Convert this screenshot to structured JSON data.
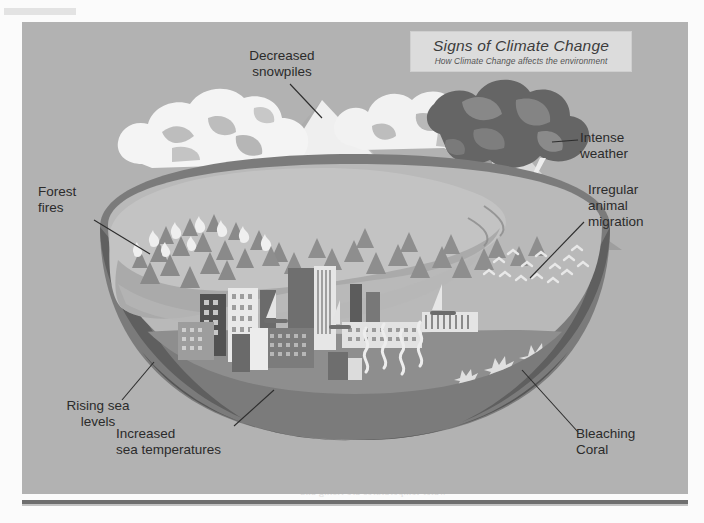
{
  "document": {
    "kind": "scanned-textbook-page",
    "page_background": "#fbfbfb",
    "panel_background": "#b2b2b2"
  },
  "illustration": {
    "title_plate": {
      "title": "Signs of Climate Change",
      "subtitle": "How Climate Change affects the environment",
      "plate_color": "#dcdcdc"
    },
    "labels": [
      {
        "id": "decreased-snowpiles",
        "text": "Decreased\nsnowpiles",
        "align": "center"
      },
      {
        "id": "intense-weather",
        "text": "Intense\nweather",
        "align": "left"
      },
      {
        "id": "irregular-migration",
        "text": "Irregular\nanimal\nmigration",
        "align": "left"
      },
      {
        "id": "forest-fires",
        "text": "Forest\nfires",
        "align": "left"
      },
      {
        "id": "rising-sea-levels",
        "text": "Rising sea\nlevels",
        "align": "center"
      },
      {
        "id": "increased-sea-temps",
        "text": "Increased\nsea temperatures",
        "align": "left"
      },
      {
        "id": "bleaching-coral",
        "text": "Bleaching\nCoral",
        "align": "left"
      }
    ],
    "scene_elements": [
      "mountain-range",
      "snow-caps",
      "white-clouds",
      "storm-cloud",
      "lightning-bolts",
      "rain",
      "pine-forest",
      "fire-flames",
      "city-skyline",
      "heat-waves",
      "sailboats",
      "ocean",
      "migrating-birds",
      "coral-reef",
      "island-landmass"
    ],
    "palette": {
      "sky": "#b2b2b2",
      "snow_white": "#f2f2f2",
      "mountain_light": "#c6c6c6",
      "mountain_mid": "#9a9a9a",
      "mountain_dark": "#6f6f6f",
      "storm_dark": "#5e5e5e",
      "storm_mid": "#7d7d7d",
      "land_light": "#c0c0c0",
      "land_mid": "#a6a6a6",
      "ocean_light": "#b8b8b8",
      "ocean_dark": "#7a7a7a",
      "earth_crust": "#6b6b6b",
      "label_text": "#2b2b2b"
    }
  },
  "bleed_through": {
    "note": "faint mirrored show-through text from the reverse side of the scanned page",
    "lines": [
      "of released into the water and are some of",
      "Thanks to the and the sun the air and",
      "normal parts of life on earth can be",
      "greenhouse gases in the atmosphere",
      "WHAT LAY A PERSON DO",
      "Where a there to work on country level",
      "the amount of energy used in the home",
      "renewable sources of energy are",
      "since there is work on country level",
      "but the difference can be made",
      "water temperatures are rising and",
      "coral reefs are being bleached",
      "global average temperatures"
    ]
  }
}
